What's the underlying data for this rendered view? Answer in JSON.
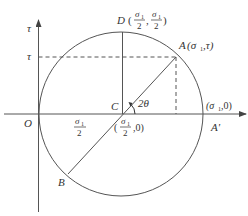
{
  "diagram": {
    "axes": {
      "x_label": "σ",
      "y_label": "τ",
      "origin_label": "O"
    },
    "points": {
      "O": {
        "label": "O"
      },
      "C": {
        "label": "C"
      },
      "D": {
        "label": "D",
        "coords_num": "σ",
        "coords_sub": "1",
        "coords_den": "2"
      },
      "A": {
        "label": "A",
        "coords": "(σ",
        "sub": "1",
        "tail": ",τ)"
      },
      "B": {
        "label": "B"
      },
      "A_prime": {
        "label": "A'"
      },
      "sigma1_axis": {
        "text": "(σ",
        "sub": "1",
        "tail": ",0)"
      },
      "center": {
        "open": "(",
        "num": "σ",
        "sub": "1",
        "den": "2",
        "tail": ",0)"
      }
    },
    "tau_tick_label": "τ",
    "tau_axis_label": "τ",
    "segment_label": {
      "num": "σ",
      "sub": "1",
      "den": "2"
    },
    "angle_label": "2θ",
    "colors": {
      "line": "#555555",
      "dashed": "#555555",
      "text": "#333333"
    }
  }
}
